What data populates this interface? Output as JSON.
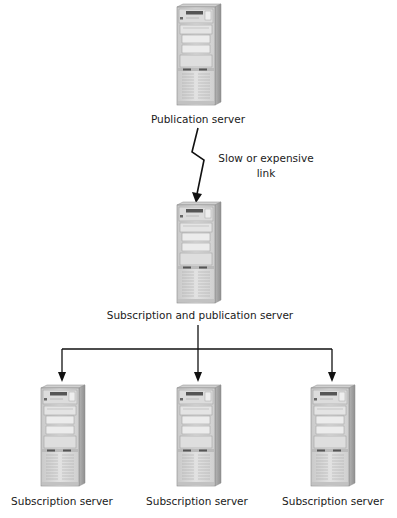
{
  "diagram": {
    "type": "replication-topology",
    "colors": {
      "background": "#ffffff",
      "line": "#111111",
      "server_front": "#d9d9d9",
      "server_side": "#a8a8a8",
      "server_top": "#c4c4c4",
      "text": "#1a1a1a"
    },
    "nodes": [
      {
        "id": "publication",
        "label": "Publication server",
        "icon": "server-tower-icon"
      },
      {
        "id": "sub-pub",
        "label": "Subscription and publication server",
        "icon": "server-tower-icon"
      },
      {
        "id": "sub1",
        "label": "Subscription server",
        "icon": "server-tower-icon"
      },
      {
        "id": "sub2",
        "label": "Subscription server",
        "icon": "server-tower-icon"
      },
      {
        "id": "sub3",
        "label": "Subscription server",
        "icon": "server-tower-icon"
      }
    ],
    "edges": [
      {
        "from": "publication",
        "to": "sub-pub",
        "style": "lightning-bolt",
        "label_line1": "Slow or expensive",
        "label_line2": "link"
      },
      {
        "from": "sub-pub",
        "to": "sub1",
        "style": "arrow"
      },
      {
        "from": "sub-pub",
        "to": "sub2",
        "style": "arrow"
      },
      {
        "from": "sub-pub",
        "to": "sub3",
        "style": "arrow"
      }
    ]
  }
}
